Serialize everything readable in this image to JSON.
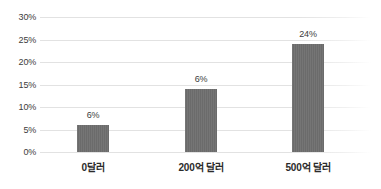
{
  "chart_data": {
    "type": "bar",
    "title": "",
    "subtitle": "",
    "xlabel": "",
    "ylabel": "",
    "categories": [
      "0달러",
      "200억 달러",
      "500억 달러"
    ],
    "values": [
      6,
      14,
      24
    ],
    "data_labels": [
      "6%",
      "6%",
      "24%"
    ],
    "ylim": [
      0,
      30
    ],
    "ytick_values": [
      0,
      5,
      10,
      15,
      20,
      25,
      30
    ],
    "ytick_labels": [
      "0%",
      "5%",
      "10%",
      "15%",
      "20%",
      "25%",
      "30%"
    ],
    "grid": true,
    "legend": false,
    "legend_position": "none",
    "series": [
      {
        "name": "",
        "values": [
          6,
          14,
          24
        ]
      }
    ]
  },
  "style": {
    "bar_color": "#6e6e6e",
    "gridline_color": "#e2e2e2",
    "text_color": "#3c3c3c",
    "category_text_color": "#2b2b2b",
    "background": "#ffffff"
  }
}
